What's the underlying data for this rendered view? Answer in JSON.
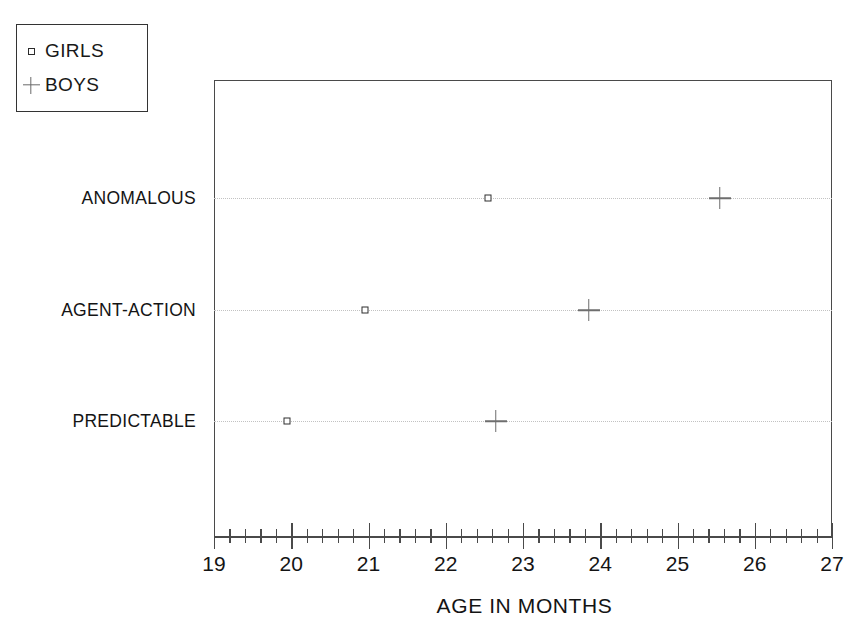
{
  "chart_data": {
    "type": "scatter",
    "title": "",
    "xlabel": "AGE IN MONTHS",
    "ylabel": "",
    "xlim": [
      19,
      27
    ],
    "xticks": [
      19,
      20,
      21,
      22,
      23,
      24,
      25,
      26,
      27
    ],
    "xtick_labels": [
      "19",
      "20",
      "21",
      "22",
      "23",
      "24",
      "25",
      "26",
      "27"
    ],
    "minor_ticks_per_interval": 4,
    "grid": "dotted horizontal gridlines at each category",
    "legend_position": "top-left outside",
    "categories": [
      "ANOMALOUS",
      "AGENT-ACTION",
      "PREDICTABLE"
    ],
    "series": [
      {
        "name": "GIRLS",
        "marker": "open-square",
        "color": "#2e2e2e",
        "points": [
          {
            "category": "ANOMALOUS",
            "x": 22.55
          },
          {
            "category": "AGENT-ACTION",
            "x": 20.95
          },
          {
            "category": "PREDICTABLE",
            "x": 19.95
          }
        ]
      },
      {
        "name": "BOYS",
        "marker": "plus",
        "color": "#6e6e6e",
        "points": [
          {
            "category": "ANOMALOUS",
            "x": 25.55
          },
          {
            "category": "AGENT-ACTION",
            "x": 23.85
          },
          {
            "category": "PREDICTABLE",
            "x": 22.65
          }
        ]
      }
    ]
  },
  "legend": {
    "entries": [
      {
        "label": "GIRLS",
        "marker": "open-square"
      },
      {
        "label": "BOYS",
        "marker": "plus"
      }
    ]
  },
  "axis": {
    "x_title": "AGE IN MONTHS",
    "tick_labels": [
      "19",
      "20",
      "21",
      "22",
      "23",
      "24",
      "25",
      "26",
      "27"
    ]
  },
  "categories": {
    "labels": [
      "ANOMALOUS",
      "AGENT-ACTION",
      "PREDICTABLE"
    ]
  }
}
